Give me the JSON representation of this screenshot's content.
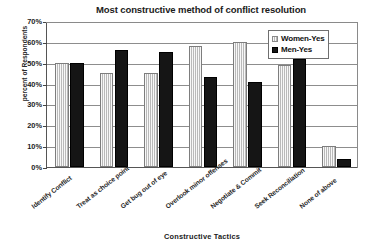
{
  "chart_data": {
    "type": "bar",
    "title": "Most constructive method of conflict resolution",
    "xlabel": "Constructive Tactics",
    "ylabel": "percent of Respondents",
    "ylim": [
      0,
      70
    ],
    "ytick_labels": [
      "70%",
      "60%",
      "50%",
      "40%",
      "30%",
      "20%",
      "10%",
      "0%"
    ],
    "ytick_values": [
      70,
      60,
      50,
      40,
      30,
      20,
      10,
      0
    ],
    "grid": true,
    "legend_position": "top-right",
    "categories": [
      "Identify Conflict",
      "Treat as choice point",
      "Get bug out of eye",
      "Overlook minor offenses",
      "Negotiate & Commit",
      "Seek Reconciliation",
      "None of above"
    ],
    "series": [
      {
        "name": "Women-Yes",
        "color": "#cccccc",
        "values": [
          50,
          45,
          45,
          58,
          60,
          49,
          10
        ]
      },
      {
        "name": "Men-Yes",
        "color": "#151515",
        "values": [
          50,
          56,
          55,
          43,
          41,
          52,
          4
        ]
      }
    ]
  },
  "legend": {
    "items": [
      {
        "label": "Women-Yes",
        "swatch": "women"
      },
      {
        "label": "Men-Yes",
        "swatch": "men"
      }
    ]
  }
}
